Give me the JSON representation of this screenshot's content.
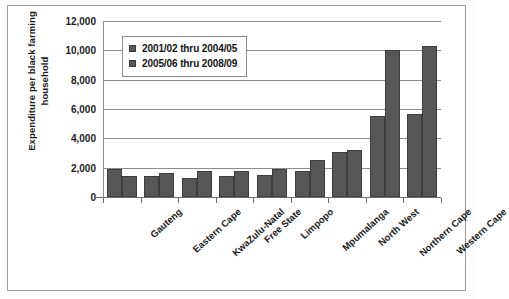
{
  "chart_data": {
    "type": "bar",
    "title": "",
    "xlabel": "",
    "ylabel": "Expenditure per black farming household",
    "ylabel_lines": [
      "Expenditure  per black farming",
      "household"
    ],
    "categories": [
      "Gauteng",
      "Eastern Cape",
      "KwaZulu-Natal",
      "Free State",
      "Limpopo",
      "Mpumalanga",
      "North West",
      "Northern Cape",
      "Western Cape"
    ],
    "series": [
      {
        "name": "2001/02 thru 2004/05",
        "values": [
          1900,
          1400,
          1300,
          1400,
          1500,
          1750,
          3050,
          5500,
          5650
        ]
      },
      {
        "name": "2005/06 thru 2008/09",
        "values": [
          1450,
          1650,
          1800,
          1780,
          1900,
          2500,
          3200,
          10000,
          10300
        ]
      }
    ],
    "ylim": [
      0,
      12000
    ],
    "yticks": [
      0,
      2000,
      4000,
      6000,
      8000,
      10000,
      12000
    ],
    "ytick_labels": [
      "0",
      "2,000",
      "4,000",
      "6,000",
      "8,000",
      "10,000",
      "12,000"
    ],
    "grid": true,
    "legend_position": "upper-left-inside",
    "colors": {
      "series_1": "#575757",
      "series_2": "#575757",
      "gridline": "#8d8d8d",
      "axis": "#6f6f6f",
      "text": "#1a1a1a",
      "frame": "#9a9a9a"
    }
  }
}
